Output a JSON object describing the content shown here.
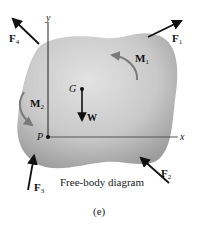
{
  "diagram": {
    "caption": "Free-body diagram",
    "sublabel": "(e)",
    "axes": {
      "x_label": "x",
      "y_label": "y"
    },
    "points": {
      "center_of_gravity": "G",
      "origin": "P"
    },
    "forces": {
      "F1": {
        "letter": "F",
        "sub": "1"
      },
      "F2": {
        "letter": "F",
        "sub": "2"
      },
      "F3": {
        "letter": "F",
        "sub": "3"
      },
      "F4": {
        "letter": "F",
        "sub": "4"
      },
      "W": {
        "letter": "W"
      }
    },
    "moments": {
      "M1": {
        "letter": "M",
        "sub": "1"
      },
      "M2": {
        "letter": "M",
        "sub": "2"
      }
    },
    "colors": {
      "body_light": "#dcdcdc",
      "body_dark": "#9a9a9a",
      "arrow": "#111111",
      "moment_arrow": "#7a7a7a"
    }
  }
}
